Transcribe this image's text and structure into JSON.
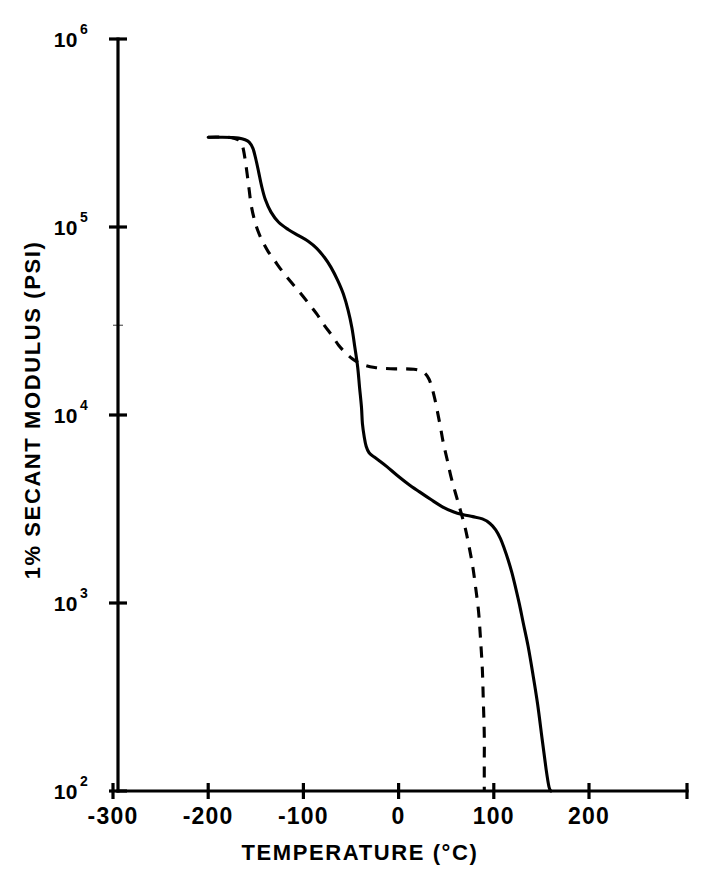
{
  "figure": {
    "background_color": "#ffffff",
    "ink_color": "#000000"
  },
  "chart_data": {
    "type": "line",
    "title": "",
    "xlabel": "TEMPERATURE (°C)",
    "ylabel": "1% SECANT MODULUS (PSI)",
    "yscale": "log",
    "xlim": [
      -320,
      270
    ],
    "ylim": [
      100,
      1000000
    ],
    "grid": false,
    "legend": null,
    "x_ticks": [
      -300,
      -200,
      -100,
      0,
      100,
      200
    ],
    "x_tick_labels": [
      "-300",
      "-200",
      "-100",
      "0",
      "100",
      "200"
    ],
    "y_ticks": [
      100,
      1000,
      10000,
      100000,
      1000000
    ],
    "y_tick_labels": [
      "10",
      "10",
      "10",
      "10",
      "10"
    ],
    "y_tick_exponents": [
      "2",
      "3",
      "4",
      "5",
      "6"
    ],
    "y_minor_ticks": [
      30000
    ],
    "series": [
      {
        "name": "solid-curve",
        "style": "solid",
        "points": [
          [
            -200,
            300000
          ],
          [
            -185,
            300000
          ],
          [
            -175,
            299000
          ],
          [
            -168,
            297000
          ],
          [
            -162,
            292000
          ],
          [
            -157,
            283000
          ],
          [
            -153,
            262000
          ],
          [
            -150,
            230000
          ],
          [
            -147,
            196000
          ],
          [
            -144,
            166000
          ],
          [
            -140,
            140000
          ],
          [
            -134,
            120000
          ],
          [
            -126,
            106000
          ],
          [
            -116,
            97000
          ],
          [
            -105,
            90000
          ],
          [
            -95,
            84000
          ],
          [
            -86,
            77000
          ],
          [
            -78,
            69000
          ],
          [
            -71,
            61000
          ],
          [
            -64,
            52000
          ],
          [
            -58,
            44000
          ],
          [
            -53,
            36000
          ],
          [
            -49,
            29000
          ],
          [
            -46,
            23000
          ],
          [
            -43,
            18000
          ],
          [
            -41,
            14000
          ],
          [
            -39,
            11000
          ],
          [
            -38,
            9000
          ],
          [
            -36,
            7600
          ],
          [
            -34,
            6800
          ],
          [
            -31,
            6300
          ],
          [
            -26,
            6000
          ],
          [
            -20,
            5700
          ],
          [
            -12,
            5300
          ],
          [
            -2,
            4800
          ],
          [
            10,
            4300
          ],
          [
            22,
            3900
          ],
          [
            34,
            3550
          ],
          [
            46,
            3250
          ],
          [
            58,
            3050
          ],
          [
            68,
            2950
          ],
          [
            78,
            2880
          ],
          [
            88,
            2800
          ],
          [
            96,
            2650
          ],
          [
            102,
            2450
          ],
          [
            107,
            2200
          ],
          [
            111,
            1950
          ],
          [
            115,
            1700
          ],
          [
            119,
            1450
          ],
          [
            123,
            1200
          ],
          [
            127,
            980
          ],
          [
            131,
            780
          ],
          [
            136,
            590
          ],
          [
            141,
            420
          ],
          [
            146,
            290
          ],
          [
            151,
            185
          ],
          [
            155,
            130
          ],
          [
            158,
            105
          ],
          [
            160,
            100
          ]
        ]
      },
      {
        "name": "dashed-curve",
        "style": "dashed",
        "points": [
          [
            -200,
            300000
          ],
          [
            -192,
            301000
          ],
          [
            -184,
            301000
          ],
          [
            -177,
            299000
          ],
          [
            -172,
            296000
          ],
          [
            -168,
            290000
          ],
          [
            -165,
            280000
          ],
          [
            -163,
            258000
          ],
          [
            -161,
            225000
          ],
          [
            -159,
            190000
          ],
          [
            -157,
            158000
          ],
          [
            -155,
            132000
          ],
          [
            -152,
            112000
          ],
          [
            -148,
            96000
          ],
          [
            -143,
            84000
          ],
          [
            -137,
            74000
          ],
          [
            -130,
            66000
          ],
          [
            -122,
            58000
          ],
          [
            -113,
            51000
          ],
          [
            -104,
            45000
          ],
          [
            -95,
            39500
          ],
          [
            -86,
            34500
          ],
          [
            -78,
            30000
          ],
          [
            -70,
            26500
          ],
          [
            -63,
            23500
          ],
          [
            -56,
            21500
          ],
          [
            -49,
            20000
          ],
          [
            -42,
            19000
          ],
          [
            -34,
            18300
          ],
          [
            -25,
            17900
          ],
          [
            -15,
            17700
          ],
          [
            -4,
            17600
          ],
          [
            7,
            17600
          ],
          [
            16,
            17500
          ],
          [
            23,
            17200
          ],
          [
            28,
            16600
          ],
          [
            32,
            15500
          ],
          [
            35,
            14000
          ],
          [
            38,
            12200
          ],
          [
            41,
            10300
          ],
          [
            44,
            8600
          ],
          [
            47,
            7100
          ],
          [
            51,
            5800
          ],
          [
            55,
            4700
          ],
          [
            60,
            3800
          ],
          [
            65,
            3100
          ],
          [
            70,
            2500
          ],
          [
            74,
            2000
          ],
          [
            78,
            1550
          ],
          [
            81,
            1200
          ],
          [
            84,
            900
          ],
          [
            86,
            650
          ],
          [
            88,
            440
          ],
          [
            89,
            300
          ],
          [
            90,
            200
          ],
          [
            90,
            140
          ],
          [
            90,
            100
          ]
        ]
      }
    ]
  }
}
